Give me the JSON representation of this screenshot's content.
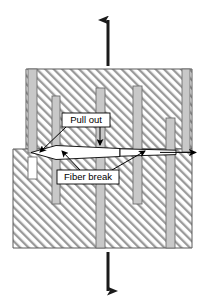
{
  "figure": {
    "background_color": "#ffffff"
  },
  "colors": {
    "matrix_hatch": "#9a9a9a",
    "matrix_fill": "#ffffff",
    "matrix_outline": "#4d4d4d",
    "fiber_fill": "#c8c8c8",
    "fiber_outline": "#6e6e6e",
    "crack_fill": "#ffffff",
    "crack_outline": "#000000",
    "arrow_color": "#1a1a1a",
    "label_box_fill": "#ffffff",
    "label_box_outline": "#000000",
    "label_text": "#000000"
  },
  "load_arrows": {
    "top": {
      "name": "tensile-load-up",
      "direction": "up",
      "x": 108,
      "y_tail": 66,
      "y_head": 18
    },
    "bottom": {
      "name": "tensile-load-down",
      "direction": "down",
      "x": 108,
      "y_tail": 252,
      "y_head": 293
    }
  },
  "matrix": {
    "upper_block": {
      "x": 26,
      "y": 69,
      "width": 166,
      "height": 80
    },
    "lower_block": {
      "x": 13,
      "y": 149,
      "width": 179,
      "height": 99
    },
    "notch_note": "left edge steps outward below the crack plane"
  },
  "fibers": [
    {
      "id": "fiber-1",
      "x": 28,
      "y": 69,
      "width": 9,
      "height": 84
    },
    {
      "id": "fiber-2",
      "x": 52,
      "y": 96,
      "width": 8,
      "height": 108
    },
    {
      "id": "fiber-3",
      "x": 96,
      "y": 88,
      "width": 9,
      "height": 160
    },
    {
      "id": "fiber-4",
      "x": 133,
      "y": 86,
      "width": 9,
      "height": 118
    },
    {
      "id": "fiber-5",
      "x": 166,
      "y": 118,
      "width": 9,
      "height": 130
    },
    {
      "id": "fiber-6",
      "x": 182,
      "y": 69,
      "width": 8,
      "height": 83
    },
    {
      "id": "fiber-1-pullout-stub",
      "x": 28,
      "y": 157,
      "width": 9,
      "height": 22
    }
  ],
  "crack": {
    "name": "matrix-crack",
    "y_center": 152,
    "x_start": 30,
    "x_end": 196,
    "description": "transverse matrix crack opening"
  },
  "labels": [
    {
      "id": "pull-out",
      "text": "Pull out",
      "box": {
        "x": 62,
        "y": 113,
        "width": 48,
        "height": 14
      },
      "leaders": [
        {
          "from_x": 66,
          "from_y": 127,
          "to_x": 39,
          "to_y": 153
        },
        {
          "from_x": 100,
          "from_y": 127,
          "to_x": 100,
          "to_y": 146
        }
      ]
    },
    {
      "id": "fiber-break",
      "text": "Fiber break",
      "box": {
        "x": 57,
        "y": 170,
        "width": 62,
        "height": 14
      },
      "leaders": [
        {
          "from_x": 78,
          "from_y": 170,
          "to_x": 62,
          "to_y": 152
        },
        {
          "from_x": 112,
          "from_y": 170,
          "to_x": 146,
          "to_y": 152
        }
      ]
    }
  ]
}
